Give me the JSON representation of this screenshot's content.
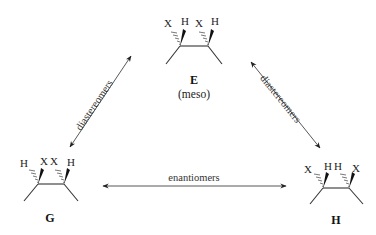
{
  "diagram": {
    "type": "stereoisomer-relationship",
    "molecules": {
      "E": {
        "label": "E",
        "sublabel": "(meso)",
        "left_carbon": {
          "hashed": "X",
          "wedged": "H"
        },
        "right_carbon": {
          "hashed": "X",
          "wedged": "H"
        }
      },
      "G": {
        "label": "G",
        "left_carbon": {
          "hashed": "H",
          "wedged": "X"
        },
        "right_carbon": {
          "hashed": "X",
          "wedged": "H"
        }
      },
      "H": {
        "label": "H",
        "left_carbon": {
          "hashed": "X",
          "wedged": "H"
        },
        "right_carbon": {
          "hashed": "H",
          "wedged": "X"
        }
      }
    },
    "relationships": [
      {
        "from": "G",
        "to": "E",
        "label": "diastereomers"
      },
      {
        "from": "E",
        "to": "H",
        "label": "diastereomers"
      },
      {
        "from": "G",
        "to": "H",
        "label": "enantiomers"
      }
    ]
  }
}
